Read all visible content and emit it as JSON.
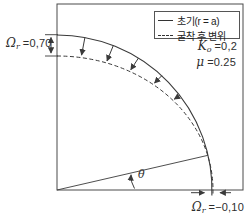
{
  "legend": {
    "items": [
      {
        "name": "initial-shape",
        "style": "solid",
        "label": "초기(r = a)"
      },
      {
        "name": "after-excavation-displacement",
        "style": "dashed",
        "label": "굴착 후 변위"
      }
    ]
  },
  "labels": {
    "crown_displacement": {
      "symbol": "Ω",
      "sub": "r",
      "value": "=0,70"
    },
    "springline_displacement": {
      "symbol": "Ω",
      "sub": "r",
      "value": "=−0,10"
    },
    "k0": {
      "symbol": "K",
      "sub": "o",
      "value": "=0,2"
    },
    "mu": {
      "symbol": "μ",
      "value": "=0.25"
    },
    "theta": {
      "symbol": "θ"
    }
  },
  "colors": {
    "line": "#3a3a3a",
    "text": "#2e2e2e",
    "legend_border": "#555555",
    "background": "#ffffff"
  }
}
